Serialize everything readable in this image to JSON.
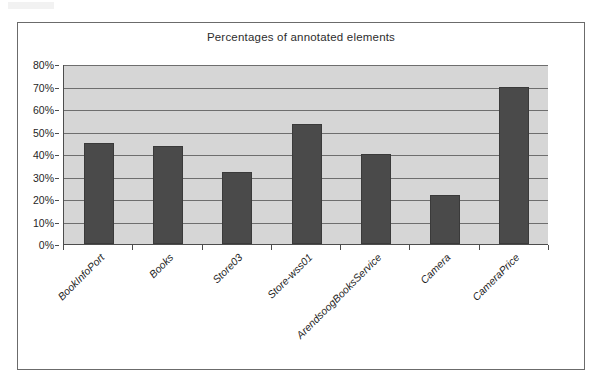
{
  "figure": {
    "title": "Percentages of annotated elements"
  },
  "chart_data": {
    "type": "bar",
    "title": "Percentages of annotated elements",
    "xlabel": "",
    "ylabel": "",
    "ylim": [
      0,
      80
    ],
    "grid": true,
    "legend": "none",
    "y_tick_labels": [
      "0%",
      "10%",
      "20%",
      "30%",
      "40%",
      "50%",
      "60%",
      "70%",
      "80%"
    ],
    "y_tick_values": [
      0,
      10,
      20,
      30,
      40,
      50,
      60,
      70,
      80
    ],
    "categories": [
      "BookInfoPort",
      "Books",
      "Store03",
      "Store-wss01",
      "ArendsoogBooksService",
      "Camera",
      "CameraPrice"
    ],
    "values": [
      45,
      43.5,
      32,
      53.5,
      40,
      22,
      70
    ],
    "bar_color": "#4a4a4a",
    "plot_background": "#d6d6d6",
    "axis_color": "#4d4d4d"
  }
}
